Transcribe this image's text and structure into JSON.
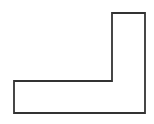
{
  "canvas": {
    "width": 154,
    "height": 124,
    "background_color": "#FFFFFF"
  },
  "figure": {
    "name": "l-shaped-polygon",
    "stroke_color": "#333333",
    "fill_color": "#FFFFFF",
    "stroke_width": 1.8,
    "vertices": [
      {
        "label": "A",
        "x": 112,
        "y": 13
      },
      {
        "label": "B",
        "x": 145,
        "y": 13
      },
      {
        "label": "C",
        "x": 145,
        "y": 113
      },
      {
        "label": "D",
        "x": 14,
        "y": 113
      },
      {
        "label": "E",
        "x": 14,
        "y": 81
      },
      {
        "label": "F",
        "x": 112,
        "y": 81
      }
    ],
    "path": "M 112 13 L 145 13 L 145 113 L 14 113 L 14 81 L 112 81 Z"
  }
}
